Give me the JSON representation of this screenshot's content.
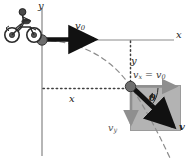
{
  "figure": {
    "colors": {
      "axis": "#7a7a7a",
      "vector": "#111111",
      "box_fill": "#b3b3b3",
      "box_edge": "#9a9a9a",
      "trajectory": "#8c8c8c",
      "dotted": "#4a4a4a",
      "label": "#222222"
    },
    "labels": {
      "y_axis": "y",
      "x_axis": "x",
      "v0": "v",
      "v0_sub": "0",
      "y_drop": "y",
      "x_range": "x",
      "vx_v": "v",
      "vx_sub": "x",
      "vx_eq": " = ",
      "vx_rhs": "v",
      "vx_rhs_sub": "0",
      "theta": "θ",
      "vy": "v",
      "vy_sub": "y",
      "v_final": "v"
    },
    "icons": {
      "motorcycle": "motorcycle-icon",
      "origin_point": "origin-dot-icon",
      "drop_point": "position-dot-icon",
      "v0_arrow": "horizontal-velocity-arrow-icon",
      "vx_arrow": "vx-component-arrow-icon",
      "vy_arrow": "vy-component-arrow-icon",
      "v_arrow": "resultant-velocity-arrow-icon",
      "trajectory": "parabolic-trajectory-icon",
      "angle_arc": "angle-arc-icon"
    }
  }
}
